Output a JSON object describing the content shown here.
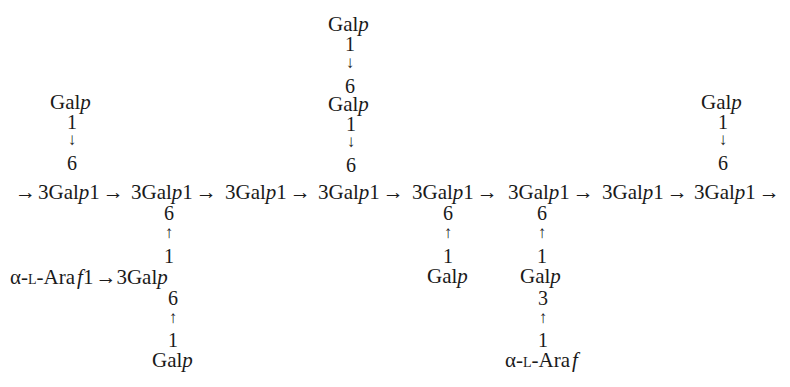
{
  "diagram": {
    "type": "polysaccharide-structure",
    "main_chain": {
      "lead_arrow": "→",
      "residues": [
        {
          "label": "3Gal",
          "ring": "p",
          "link": "1",
          "arrow": "→"
        },
        {
          "label": "3Gal",
          "ring": "p",
          "link": "1",
          "arrow": "→"
        },
        {
          "label": "3Gal",
          "ring": "p",
          "link": "1",
          "arrow": "→"
        },
        {
          "label": "3Gal",
          "ring": "p",
          "link": "1",
          "arrow": "→"
        },
        {
          "label": "3Gal",
          "ring": "p",
          "link": "1",
          "arrow": "→"
        },
        {
          "label": "3Gal",
          "ring": "p",
          "link": "1",
          "arrow": "→"
        },
        {
          "label": "3Gal",
          "ring": "p",
          "link": "1",
          "arrow": "→"
        },
        {
          "label": "3Gal",
          "ring": "p",
          "link": "1",
          "arrow": "→"
        }
      ]
    },
    "branches": {
      "b1": {
        "sugar": "Gal",
        "ring": "p",
        "from": "1",
        "arrow": "↓",
        "to": "6"
      },
      "b4a": {
        "sugar": "Gal",
        "ring": "p",
        "from": "1",
        "arrow": "↓",
        "to": "6"
      },
      "b4b": {
        "sugar": "Gal",
        "ring": "p",
        "from": "1",
        "arrow": "↓",
        "to": "6"
      },
      "b8": {
        "sugar": "Gal",
        "ring": "p",
        "from": "1",
        "arrow": "↓",
        "to": "6"
      },
      "b2": {
        "to": "6",
        "arrow": "↑",
        "from": "1",
        "ara_prefix": "α-",
        "ara_l": "L",
        "ara_name": "-Ara",
        "ara_ring": "f",
        "ara_link": "1",
        "ara_arrow": "→",
        "mid_sugar": "3Gal",
        "mid_ring": "p",
        "mid_to": "6",
        "mid_arrow": "↑",
        "mid_from": "1",
        "end_sugar": "Gal",
        "end_ring": "p"
      },
      "b5": {
        "to": "6",
        "arrow": "↑",
        "from": "1",
        "sugar": "Gal",
        "ring": "p"
      },
      "b6": {
        "to": "6",
        "arrow": "↑",
        "from": "1",
        "sugar": "Gal",
        "ring": "p",
        "sub_to": "3",
        "sub_arrow": "↑",
        "sub_from": "1",
        "ara_prefix": "α-",
        "ara_l": "L",
        "ara_name": "-Ara",
        "ara_ring": "f"
      }
    }
  }
}
